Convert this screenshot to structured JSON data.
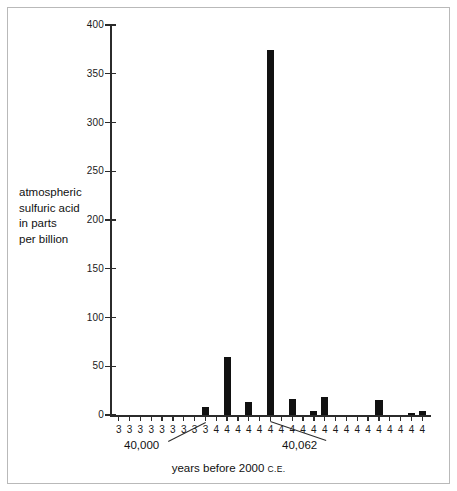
{
  "figure": {
    "y_caption_lines": [
      "atmospheric",
      "sulfuric acid",
      "in parts",
      "per billion"
    ],
    "x_caption_main": "years before 2000",
    "x_caption_small": "C.E.",
    "annotations": [
      {
        "text": "40,000",
        "target_index": 8
      },
      {
        "text": "40,062",
        "target_index": 14
      }
    ]
  },
  "chart_data": {
    "type": "bar",
    "title": "",
    "xlabel": "years before 2000 C.E.",
    "ylabel": "atmospheric sulfuric acid in parts per billion",
    "ylim": [
      0,
      400
    ],
    "yticks": [
      0,
      50,
      100,
      150,
      200,
      250,
      300,
      350,
      400
    ],
    "ytick_labels": [
      "0",
      "50",
      "100",
      "150",
      "200",
      "250",
      "300",
      "350",
      "400"
    ],
    "grid": false,
    "legend": null,
    "xtick_labels": [
      "3",
      "3",
      "3",
      "3",
      "3",
      "3",
      "3",
      "3",
      "3",
      "4",
      "4",
      "4",
      "4",
      "4",
      "4",
      "4",
      "4",
      "4",
      "4",
      "4",
      "4",
      "4",
      "4",
      "4",
      "4",
      "4",
      "4",
      "4",
      "4"
    ],
    "categories": [
      "3",
      "3",
      "3",
      "3",
      "3",
      "3",
      "3",
      "3",
      "3",
      "4",
      "4",
      "4",
      "4",
      "4",
      "4",
      "4",
      "4",
      "4",
      "4",
      "4",
      "4",
      "4",
      "4",
      "4",
      "4",
      "4",
      "4",
      "4",
      "4"
    ],
    "values": [
      0,
      0,
      0,
      0,
      0,
      0,
      0,
      0,
      8,
      0,
      59,
      0,
      13,
      0,
      374,
      0,
      16,
      0,
      4,
      18,
      0,
      0,
      0,
      0,
      15,
      0,
      0,
      2,
      4
    ],
    "notable_points": [
      {
        "label": "40,000",
        "value": 8
      },
      {
        "label": "peak at 40,062",
        "value": 374
      },
      {
        "label": "secondary peak",
        "value": 59
      }
    ]
  }
}
